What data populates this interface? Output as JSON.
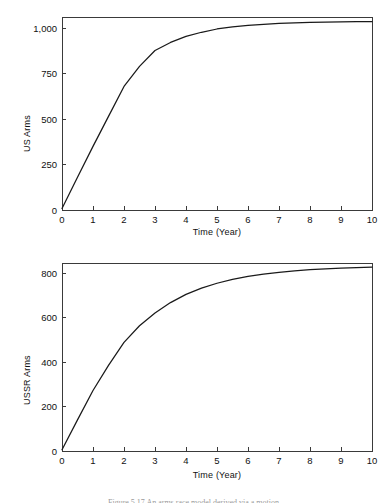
{
  "figure": {
    "caption": "Figure 5.17   An arms race model derived via a motion"
  },
  "chart_data": [
    {
      "id": "us-arms",
      "type": "line",
      "title": "",
      "xlabel": "Time (Year)",
      "ylabel": "US Arms",
      "xlim": [
        0,
        10
      ],
      "ylim": [
        0,
        1062
      ],
      "xticks": [
        "0",
        "1",
        "2",
        "3",
        "4",
        "5",
        "6",
        "7",
        "8",
        "9",
        "10"
      ],
      "xtick_values": [
        0,
        1,
        2,
        3,
        4,
        5,
        6,
        7,
        8,
        9,
        10
      ],
      "yticks": [
        "0",
        "250",
        "500",
        "750",
        "1,000"
      ],
      "ytick_values": [
        0,
        250,
        500,
        750,
        1000
      ],
      "grid": false,
      "legend": false,
      "line_color": "#1a1a1a",
      "series": [
        {
          "name": "US Arms",
          "x": [
            0,
            0.5,
            1,
            1.5,
            2,
            2.5,
            3,
            3.5,
            4,
            4.5,
            5,
            5.5,
            6,
            6.5,
            7,
            7.5,
            8,
            8.5,
            9,
            9.5,
            10
          ],
          "values": [
            8,
            180,
            350,
            515,
            680,
            790,
            878,
            922,
            955,
            978,
            996,
            1008,
            1016,
            1022,
            1027,
            1030,
            1032,
            1034,
            1035,
            1036,
            1037
          ]
        }
      ]
    },
    {
      "id": "ussr-arms",
      "type": "line",
      "title": "",
      "xlabel": "Time (Year)",
      "ylabel": "USSR Arms",
      "xlim": [
        0,
        10
      ],
      "ylim": [
        0,
        845
      ],
      "xticks": [
        "0",
        "1",
        "2",
        "3",
        "4",
        "5",
        "6",
        "7",
        "8",
        "9",
        "10"
      ],
      "xtick_values": [
        0,
        1,
        2,
        3,
        4,
        5,
        6,
        7,
        8,
        9,
        10
      ],
      "yticks": [
        "0",
        "200",
        "400",
        "600",
        "800"
      ],
      "ytick_values": [
        0,
        200,
        400,
        600,
        800
      ],
      "grid": false,
      "legend": false,
      "line_color": "#1a1a1a",
      "series": [
        {
          "name": "USSR Arms",
          "x": [
            0,
            0.5,
            1,
            1.5,
            2,
            2.5,
            3,
            3.5,
            4,
            4.5,
            5,
            5.5,
            6,
            6.5,
            7,
            7.5,
            8,
            8.5,
            9,
            9.5,
            10
          ],
          "values": [
            6,
            140,
            272,
            385,
            488,
            563,
            620,
            667,
            704,
            732,
            754,
            771,
            785,
            795,
            803,
            810,
            815,
            819,
            822,
            824,
            826
          ]
        }
      ]
    }
  ]
}
